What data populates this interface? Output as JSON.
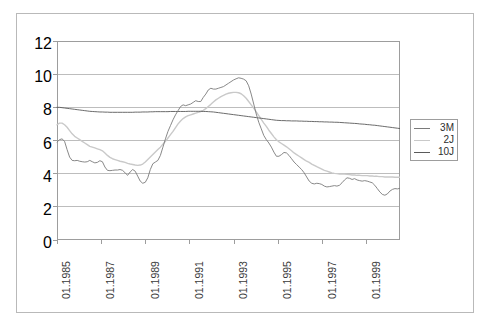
{
  "chart_data": {
    "type": "line",
    "title": "",
    "subtitle": "",
    "xlabel": "",
    "ylabel": "",
    "ylim": [
      0,
      12
    ],
    "yticks": [
      0,
      2,
      4,
      6,
      8,
      10,
      12
    ],
    "ytick_labels": [
      "0",
      "2",
      "4",
      "6",
      "8",
      "10",
      "12"
    ],
    "grid": "horizontal",
    "legend_position": "right-outside",
    "x_start": "01.1985",
    "x_end": "07.2000",
    "xtick_labels": [
      "01.1985",
      "01.1987",
      "01.1989",
      "01.1991",
      "01.1993",
      "01.1995",
      "01.1997",
      "01.1999"
    ],
    "xtick_fractions": [
      0.0,
      0.129,
      0.2581,
      0.3871,
      0.5161,
      0.6452,
      0.7742,
      0.9032
    ],
    "colors": {
      "3M": "#7a7a7a",
      "2J": "#c9c9c9",
      "10J": "#5a5a5a",
      "grid": "#bdbdbd",
      "axis": "#9d9d9d",
      "frame": "#b9b9b9",
      "text": "#3a3a3a"
    },
    "series": [
      {
        "name": "3M",
        "label": "3M",
        "color": "#7a7a7a",
        "values": [
          5.9,
          6.05,
          6.1,
          5.95,
          5.45,
          5.0,
          4.8,
          4.78,
          4.8,
          4.75,
          4.72,
          4.7,
          4.72,
          4.8,
          4.72,
          4.65,
          4.68,
          4.78,
          4.72,
          4.4,
          4.2,
          4.18,
          4.2,
          4.22,
          4.22,
          4.25,
          4.2,
          4.05,
          3.9,
          4.1,
          4.25,
          4.15,
          3.85,
          3.55,
          3.42,
          3.48,
          3.75,
          4.25,
          4.6,
          4.7,
          4.8,
          5.1,
          5.6,
          6.1,
          6.55,
          6.9,
          7.25,
          7.55,
          7.8,
          8.05,
          8.15,
          8.1,
          8.15,
          8.2,
          8.3,
          8.4,
          8.35,
          8.35,
          8.6,
          8.8,
          9.05,
          9.15,
          9.1,
          9.1,
          9.15,
          9.2,
          9.25,
          9.35,
          9.45,
          9.55,
          9.65,
          9.72,
          9.78,
          9.75,
          9.7,
          9.6,
          9.3,
          8.8,
          8.2,
          7.6,
          7.1,
          6.7,
          6.3,
          6.05,
          5.85,
          5.6,
          5.3,
          5.05,
          5.05,
          5.15,
          5.28,
          5.25,
          5.1,
          4.9,
          4.7,
          4.55,
          4.4,
          4.25,
          4.05,
          3.8,
          3.55,
          3.42,
          3.38,
          3.42,
          3.4,
          3.35,
          3.25,
          3.2,
          3.22,
          3.25,
          3.28,
          3.25,
          3.3,
          3.45,
          3.62,
          3.75,
          3.72,
          3.65,
          3.7,
          3.62,
          3.58,
          3.55,
          3.58,
          3.55,
          3.5,
          3.45,
          3.3,
          3.1,
          2.9,
          2.75,
          2.7,
          2.78,
          2.95,
          3.05,
          3.1,
          3.08,
          3.12
        ]
      },
      {
        "name": "2J",
        "label": "2J",
        "color": "#c9c9c9",
        "values": [
          6.95,
          7.05,
          7.05,
          6.95,
          6.8,
          6.6,
          6.4,
          6.25,
          6.15,
          6.05,
          5.95,
          5.85,
          5.75,
          5.65,
          5.6,
          5.55,
          5.5,
          5.45,
          5.38,
          5.25,
          5.1,
          4.98,
          4.9,
          4.85,
          4.8,
          4.75,
          4.72,
          4.68,
          4.62,
          4.58,
          4.55,
          4.52,
          4.5,
          4.52,
          4.58,
          4.7,
          4.85,
          5.0,
          5.15,
          5.3,
          5.45,
          5.6,
          5.78,
          5.95,
          6.15,
          6.35,
          6.55,
          6.78,
          7.0,
          7.18,
          7.32,
          7.42,
          7.5,
          7.55,
          7.6,
          7.65,
          7.7,
          7.75,
          7.82,
          7.92,
          8.05,
          8.18,
          8.32,
          8.45,
          8.55,
          8.65,
          8.72,
          8.8,
          8.85,
          8.88,
          8.9,
          8.9,
          8.88,
          8.82,
          8.7,
          8.55,
          8.35,
          8.15,
          7.95,
          7.72,
          7.5,
          7.28,
          7.05,
          6.85,
          6.62,
          6.42,
          6.22,
          6.05,
          5.92,
          5.82,
          5.72,
          5.62,
          5.5,
          5.38,
          5.25,
          5.15,
          5.05,
          4.95,
          4.85,
          4.75,
          4.68,
          4.58,
          4.5,
          4.42,
          4.35,
          4.28,
          4.2,
          4.15,
          4.1,
          4.05,
          4.02,
          4.0,
          3.98,
          3.98,
          3.98,
          3.96,
          3.94,
          3.92,
          3.92,
          3.9,
          3.9,
          3.88,
          3.88,
          3.88,
          3.86,
          3.86,
          3.84,
          3.84,
          3.82,
          3.82,
          3.8,
          3.8,
          3.8,
          3.8,
          3.78,
          3.78,
          3.78
        ]
      },
      {
        "name": "10J",
        "label": "10J",
        "color": "#5a5a5a",
        "values": [
          8.0,
          8.0,
          7.98,
          7.96,
          7.94,
          7.92,
          7.9,
          7.88,
          7.86,
          7.84,
          7.82,
          7.8,
          7.78,
          7.76,
          7.75,
          7.74,
          7.73,
          7.72,
          7.72,
          7.71,
          7.71,
          7.7,
          7.7,
          7.7,
          7.7,
          7.7,
          7.7,
          7.7,
          7.7,
          7.7,
          7.7,
          7.71,
          7.71,
          7.71,
          7.72,
          7.72,
          7.72,
          7.73,
          7.73,
          7.74,
          7.74,
          7.74,
          7.74,
          7.74,
          7.74,
          7.75,
          7.75,
          7.75,
          7.75,
          7.75,
          7.75,
          7.75,
          7.76,
          7.76,
          7.76,
          7.76,
          7.76,
          7.76,
          7.75,
          7.75,
          7.74,
          7.73,
          7.72,
          7.7,
          7.68,
          7.66,
          7.64,
          7.62,
          7.6,
          7.58,
          7.56,
          7.54,
          7.52,
          7.5,
          7.48,
          7.46,
          7.44,
          7.42,
          7.4,
          7.38,
          7.36,
          7.34,
          7.32,
          7.3,
          7.28,
          7.26,
          7.24,
          7.22,
          7.21,
          7.2,
          7.2,
          7.19,
          7.19,
          7.18,
          7.18,
          7.18,
          7.17,
          7.17,
          7.16,
          7.16,
          7.15,
          7.15,
          7.14,
          7.14,
          7.13,
          7.13,
          7.12,
          7.12,
          7.11,
          7.11,
          7.1,
          7.1,
          7.09,
          7.08,
          7.07,
          7.06,
          7.05,
          7.04,
          7.03,
          7.02,
          7.0,
          6.99,
          6.98,
          6.96,
          6.95,
          6.93,
          6.92,
          6.9,
          6.88,
          6.86,
          6.84,
          6.82,
          6.8,
          6.78,
          6.76,
          6.74,
          6.72
        ]
      }
    ]
  },
  "legend": {
    "entries": [
      {
        "label": "3M"
      },
      {
        "label": "2J"
      },
      {
        "label": "10J"
      }
    ]
  }
}
